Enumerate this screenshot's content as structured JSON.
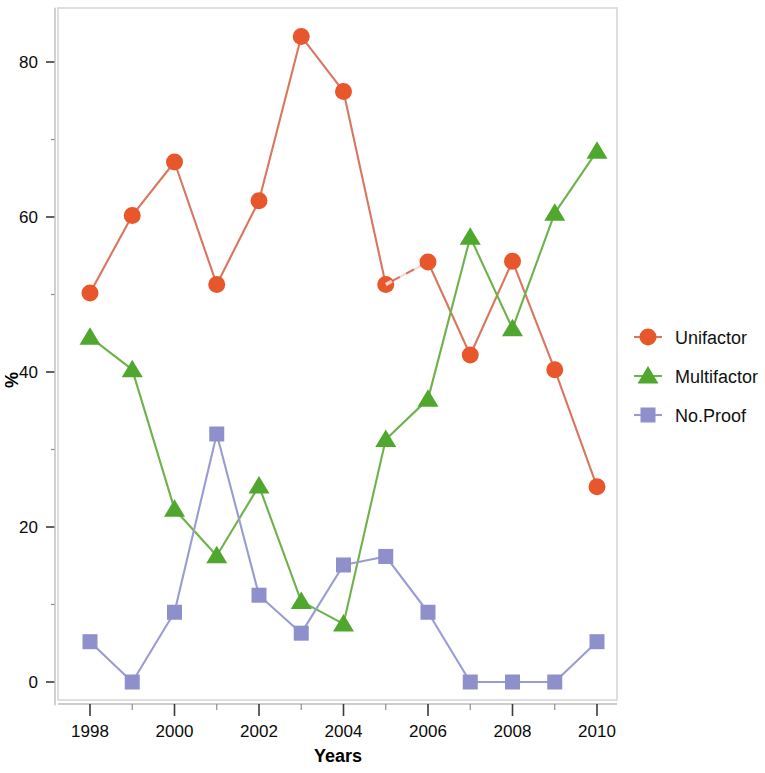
{
  "chart_data": {
    "type": "line",
    "title": "",
    "xlabel": "Years",
    "ylabel": "%",
    "x": [
      1998,
      1999,
      2000,
      2001,
      2002,
      2003,
      2004,
      2005,
      2006,
      2007,
      2008,
      2009,
      2010
    ],
    "categories": [
      "1998",
      "1999",
      "2000",
      "2001",
      "2002",
      "2003",
      "2004",
      "2005",
      "2006",
      "2007",
      "2008",
      "2009",
      "2010"
    ],
    "xlim": [
      1997.5,
      2010.6
    ],
    "ylim": [
      -3,
      87
    ],
    "grid": false,
    "legend_position": "right",
    "x_major_ticks": [
      "1998",
      "2000",
      "2002",
      "2004",
      "2006",
      "2008",
      "2010"
    ],
    "x_minor_ticks": [
      "1999",
      "2001",
      "2003",
      "2005",
      "2007",
      "2009"
    ],
    "y_major_ticks": [
      "0",
      "20",
      "40",
      "60",
      "80"
    ],
    "y_minor_ticks": [
      "10",
      "30",
      "50",
      "70"
    ],
    "series": [
      {
        "name": "Unifactor",
        "color": "#E8562C",
        "line_color": "#D9765F",
        "marker": "circle",
        "values": [
          50.2,
          60.2,
          67.1,
          51.3,
          62.1,
          83.3,
          76.2,
          51.3,
          54.2,
          42.2,
          54.3,
          40.3,
          25.2
        ]
      },
      {
        "name": "Multifactor",
        "color": "#4FA72E",
        "line_color": "#6DB24A",
        "marker": "triangle",
        "values": [
          44.5,
          40.3,
          22.3,
          16.3,
          25.3,
          10.4,
          7.5,
          31.3,
          36.5,
          57.4,
          45.6,
          60.5,
          68.5
        ]
      },
      {
        "name": "No.Proof",
        "color": "#8E8FCB",
        "line_color": "#9A9BD2",
        "marker": "square",
        "values": [
          5.2,
          0.0,
          9.0,
          32.0,
          11.2,
          6.3,
          15.1,
          16.2,
          9.0,
          0.0,
          0.0,
          0.0,
          5.2
        ]
      }
    ]
  },
  "axes": {
    "x_title": "Years",
    "y_title": "%"
  },
  "legend": {
    "entries": [
      {
        "label": "Unifactor"
      },
      {
        "label": "Multifactor"
      },
      {
        "label": "No.Proof"
      }
    ]
  }
}
